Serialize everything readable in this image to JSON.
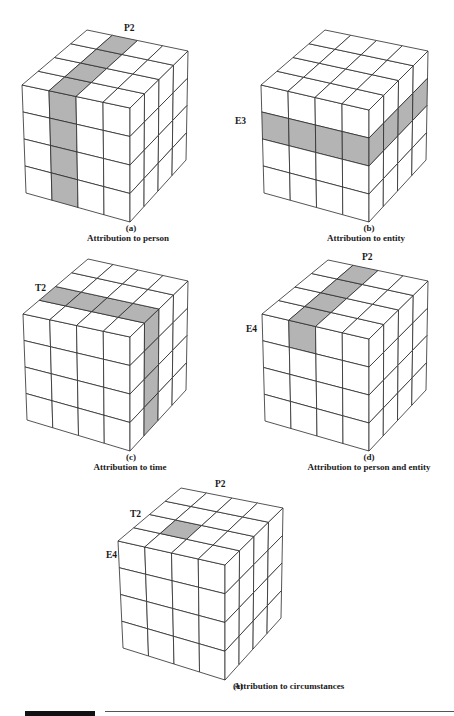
{
  "figure": {
    "shade_color": "#b4b4b4",
    "line_color": "#2a2a2a",
    "panels": [
      {
        "id": "a",
        "letter": "(a)",
        "caption": "Attribution to person",
        "labels": [
          {
            "text": "P2",
            "x": 124,
            "y": 28
          }
        ],
        "letter_pos": {
          "x": 131,
          "y": 228
        },
        "caption_pos": {
          "x": 128,
          "y": 238
        },
        "vertices": {
          "ftl": [
            22,
            85
          ],
          "ftr": [
            130,
            108
          ],
          "fbl": [
            26,
            193
          ],
          "fbr": [
            130,
            222
          ],
          "btl": [
            87,
            30
          ],
          "btr": [
            188,
            51
          ],
          "bbr": [
            186,
            160
          ]
        },
        "shade": {
          "top": [
            [
              1,
              0
            ],
            [
              1,
              1
            ],
            [
              1,
              2
            ],
            [
              1,
              3
            ]
          ],
          "front": [
            [
              1,
              0
            ],
            [
              1,
              1
            ],
            [
              1,
              2
            ],
            [
              1,
              3
            ]
          ],
          "right": []
        }
      },
      {
        "id": "b",
        "letter": "(b)",
        "caption": "Attribution to entity",
        "labels": [
          {
            "text": "E3",
            "x": 235,
            "y": 121
          }
        ],
        "letter_pos": {
          "x": 369,
          "y": 228
        },
        "caption_pos": {
          "x": 366,
          "y": 238
        },
        "vertices": {
          "ftl": [
            261,
            85
          ],
          "ftr": [
            369,
            110
          ],
          "fbl": [
            264,
            193
          ],
          "fbr": [
            369,
            222
          ],
          "btl": [
            325,
            30
          ],
          "btr": [
            428,
            51
          ],
          "bbr": [
            426,
            160
          ]
        },
        "shade": {
          "top": [],
          "front": [
            [
              0,
              1
            ],
            [
              1,
              1
            ],
            [
              2,
              1
            ],
            [
              3,
              1
            ]
          ],
          "right": [
            [
              0,
              1
            ],
            [
              1,
              1
            ],
            [
              2,
              1
            ],
            [
              3,
              1
            ]
          ]
        }
      },
      {
        "id": "c",
        "letter": "(c)",
        "caption": "Attribution to time",
        "labels": [
          {
            "text": "T2",
            "x": 35,
            "y": 288
          }
        ],
        "letter_pos": {
          "x": 131,
          "y": 457
        },
        "caption_pos": {
          "x": 130,
          "y": 467
        },
        "vertices": {
          "ftl": [
            23,
            314
          ],
          "ftr": [
            130,
            337
          ],
          "fbl": [
            27,
            420
          ],
          "fbr": [
            130,
            451
          ],
          "btl": [
            88,
            259
          ],
          "btr": [
            188,
            281
          ],
          "bbr": [
            186,
            390
          ]
        },
        "shade": {
          "top": [
            [
              0,
              1
            ],
            [
              1,
              1
            ],
            [
              2,
              1
            ],
            [
              3,
              1
            ]
          ],
          "front": [],
          "right": [
            [
              1,
              0
            ],
            [
              1,
              1
            ],
            [
              1,
              2
            ],
            [
              1,
              3
            ]
          ]
        }
      },
      {
        "id": "d",
        "letter": "(d)",
        "caption": "Attribution to person and entity",
        "labels": [
          {
            "text": "P2",
            "x": 362,
            "y": 257
          },
          {
            "text": "E4",
            "x": 246,
            "y": 329
          }
        ],
        "letter_pos": {
          "x": 369,
          "y": 457
        },
        "caption_pos": {
          "x": 369,
          "y": 467
        },
        "vertices": {
          "ftl": [
            262,
            314
          ],
          "ftr": [
            369,
            339
          ],
          "fbl": [
            265,
            421
          ],
          "fbr": [
            369,
            451
          ],
          "btl": [
            328,
            260
          ],
          "btr": [
            428,
            281
          ],
          "bbr": [
            426,
            390
          ]
        },
        "shade": {
          "top": [
            [
              1,
              0
            ],
            [
              1,
              1
            ],
            [
              1,
              2
            ],
            [
              1,
              3
            ]
          ],
          "front": [
            [
              1,
              0
            ]
          ],
          "right": []
        }
      },
      {
        "id": "e",
        "letter": "(e)",
        "caption": "Attribution to circumstances",
        "labels": [
          {
            "text": "P2",
            "x": 215,
            "y": 484
          },
          {
            "text": "T2",
            "x": 130,
            "y": 514
          },
          {
            "text": "E4",
            "x": 106,
            "y": 555
          }
        ],
        "letter_pos": {
          "x": 233,
          "y": 686
        },
        "caption_pos": {
          "x": 289,
          "y": 686
        },
        "vertices": {
          "ftl": [
            118,
            541
          ],
          "ftr": [
            225,
            565
          ],
          "fbl": [
            123,
            648
          ],
          "fbr": [
            225,
            680
          ],
          "btl": [
            181,
            488
          ],
          "btr": [
            283,
            508
          ],
          "bbr": [
            281,
            618
          ]
        },
        "shade": {
          "top": [
            [
              1,
              1
            ]
          ],
          "front": [],
          "right": []
        }
      }
    ]
  }
}
